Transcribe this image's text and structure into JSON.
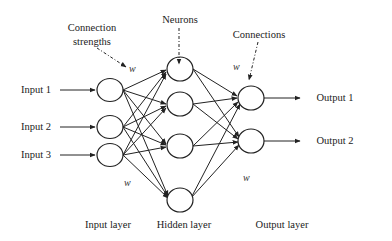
{
  "diagram": {
    "type": "feed-forward neural network",
    "inputs": [
      "Input 1",
      "Input 2",
      "Input 3"
    ],
    "outputs": [
      "Output 1",
      "Output 2"
    ],
    "layers": {
      "input": {
        "label": "Input layer",
        "node_count": 3
      },
      "hidden": {
        "label": "Hidden layer",
        "node_count": 4
      },
      "output": {
        "label": "Output layer",
        "node_count": 2
      }
    },
    "annotations": {
      "connection_strengths": "Connection strengths",
      "connection_strengths_line1": "Connection",
      "connection_strengths_line2": "strengths",
      "neurons": "Neurons",
      "connections": "Connections",
      "weight_symbol": "w"
    },
    "connectivity": "fully connected input→hidden and hidden→output"
  }
}
